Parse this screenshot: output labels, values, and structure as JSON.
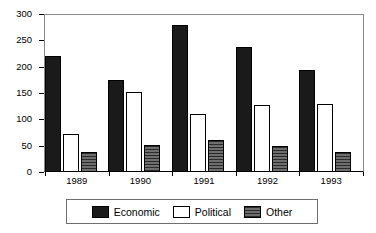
{
  "chart_data": {
    "type": "bar",
    "title": "",
    "subtitle": "",
    "xlabel": "",
    "ylabel": "",
    "categories": [
      "1989",
      "1990",
      "1991",
      "1992",
      "1993"
    ],
    "series": [
      {
        "name": "Economic",
        "color": "#1a1a1a",
        "values": [
          220,
          174,
          280,
          238,
          194
        ]
      },
      {
        "name": "Political",
        "color": "#ffffff",
        "values": [
          72,
          152,
          110,
          128,
          129
        ]
      },
      {
        "name": "Other",
        "color": "#4a4a4a",
        "values": [
          38,
          52,
          61,
          49,
          38
        ]
      }
    ],
    "ylim": [
      0,
      300
    ],
    "yticks": [
      0,
      50,
      100,
      150,
      200,
      250,
      300
    ],
    "ytick_labels": [
      "0",
      "50",
      "100",
      "150",
      "200",
      "250",
      "300"
    ],
    "grid": false,
    "legend_position": "bottom"
  },
  "legend": {
    "entries": [
      {
        "label": "Economic",
        "swatch": "solid-black-swatch"
      },
      {
        "label": "Political",
        "swatch": "outlined-white-swatch"
      },
      {
        "label": "Other",
        "swatch": "hatched-gray-swatch"
      }
    ]
  }
}
